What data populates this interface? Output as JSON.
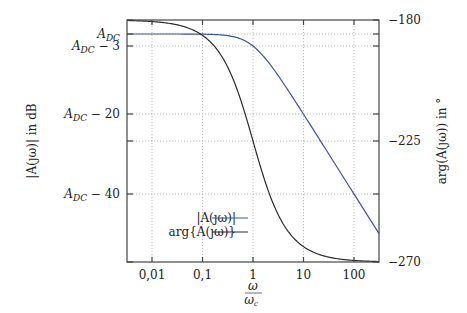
{
  "chart_data": {
    "type": "line",
    "title": "",
    "xlabel": "ω / ω_c",
    "ylabel_left": "|A(jω)| in dB",
    "ylabel_right": "arg(A(jω)) in °",
    "x_scale": "log",
    "xlim": [
      0.0032,
      313
    ],
    "ylim_left_dB_rel": [
      -57,
      3.5
    ],
    "ylim_right_deg": [
      -270,
      -180
    ],
    "grid": true,
    "x_ticks": [
      {
        "value": 0.01,
        "label": "0,01"
      },
      {
        "value": 0.1,
        "label": "0,1"
      },
      {
        "value": 1,
        "label": "1"
      },
      {
        "value": 10,
        "label": "10"
      },
      {
        "value": 100,
        "label": "100"
      }
    ],
    "y_ticks_left": [
      {
        "value": 0,
        "label": "A_DC",
        "main": "A",
        "sub": "DC",
        "suffix": ""
      },
      {
        "value": -3,
        "label": "A_DC − 3",
        "main": "A",
        "sub": "DC",
        "suffix": " − 3"
      },
      {
        "value": -20,
        "label": "A_DC − 20",
        "main": "A",
        "sub": "DC",
        "suffix": " − 20"
      },
      {
        "value": -40,
        "label": "A_DC − 40",
        "main": "A",
        "sub": "DC",
        "suffix": " − 40"
      }
    ],
    "y_ticks_right": [
      {
        "value": -180,
        "label": "−180"
      },
      {
        "value": -225,
        "label": "−225"
      },
      {
        "value": -270,
        "label": "−270"
      }
    ],
    "x": [
      0.00316,
      0.01,
      0.0316,
      0.1,
      0.316,
      1,
      3.16,
      10,
      31.6,
      100,
      313
    ],
    "series": [
      {
        "name": "|A(jω)|",
        "axis": "left",
        "unit": "dB relative to A_DC",
        "color": "#3a55a4",
        "values": [
          0,
          0,
          0,
          -0.04,
          -0.41,
          -3.01,
          -10.41,
          -20.04,
          -30.0,
          -40.0,
          -49.9
        ]
      },
      {
        "name": "arg{A(jω)}",
        "axis": "right",
        "unit": "degrees",
        "color": "#2b2b2b",
        "values": [
          -180.18,
          -180.57,
          -181.81,
          -185.71,
          -197.5,
          -225,
          -252.4,
          -264.3,
          -268.2,
          -269.4,
          -269.8
        ]
      }
    ],
    "legend": {
      "position": "lower-left-center",
      "entries": [
        {
          "label": "|A(jω)|",
          "color": "#3a55a4"
        },
        {
          "label": "arg{A(jω)}",
          "color": "#2b2b2b"
        }
      ]
    }
  },
  "labels": {
    "y_left": "|A(ȷω)| in dB",
    "y_right": "arg(A(ȷω)) in °",
    "x_num": "ω",
    "x_den": "ω",
    "x_den_sub": "c",
    "legend_mag": "|A(ȷω)|",
    "legend_phase": "arg{A(ȷω)}"
  }
}
